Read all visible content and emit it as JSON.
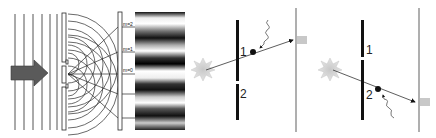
{
  "diagram": {
    "panels": [
      {
        "id": "wave-interference",
        "description": "Plane waves pass through double slit, producing interference fringes on screen",
        "order_labels": [
          "m=2",
          "m=1",
          "m=0"
        ],
        "incident_arrow": "arrow-right-icon"
      },
      {
        "id": "particle-slit-1",
        "description": "Particle passes through slit 1, detected by scattered photon, hits screen",
        "slit_labels": [
          "1",
          "2"
        ]
      },
      {
        "id": "particle-slit-2",
        "description": "Particle passes through slit 2, detected by scattered photon, hits screen",
        "slit_labels": [
          "1",
          "2"
        ]
      }
    ],
    "colors": {
      "line": "#2a2a2a",
      "barrier": "#111111",
      "arrow": "#555555",
      "source": "#b0b0b0",
      "screen": "#7a7a7a",
      "spot": "#bdbdbd"
    }
  }
}
